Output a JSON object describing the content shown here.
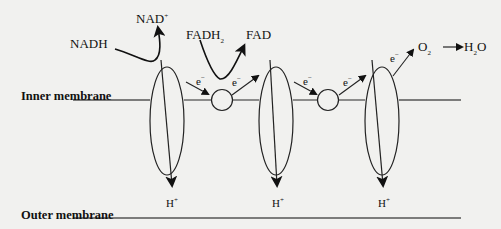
{
  "diagram": {
    "membranes": {
      "inner": "Inner membrane",
      "outer": "Outer membrane"
    },
    "donors": [
      {
        "reduced": "NADH",
        "oxidized": "NAD",
        "oxidized_sup": "+"
      },
      {
        "reduced": "FADH",
        "reduced_sub": "2",
        "oxidized": "FAD"
      }
    ],
    "electron_label": "e",
    "electron_sup": "−",
    "proton_label": "H",
    "proton_sup": "+",
    "final_acceptor": {
      "reactant": "O",
      "reactant_sub": "2",
      "product_pre": "H",
      "product_sub": "2",
      "product_post": "O"
    },
    "complex_count": 3,
    "carrier_count": 2
  }
}
